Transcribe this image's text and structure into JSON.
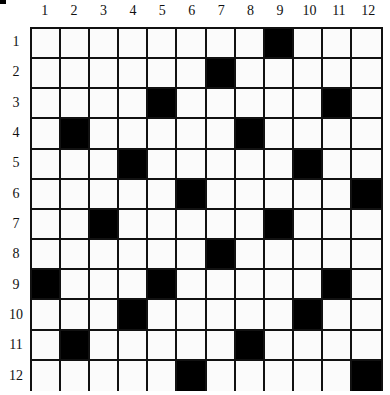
{
  "grid": {
    "rows": 12,
    "cols": 12,
    "column_labels": [
      "1",
      "2",
      "3",
      "4",
      "5",
      "6",
      "7",
      "8",
      "9",
      "10",
      "11",
      "12"
    ],
    "row_labels": [
      "1",
      "2",
      "3",
      "4",
      "5",
      "6",
      "7",
      "8",
      "9",
      "10",
      "11",
      "12"
    ],
    "black_cells": {
      "1": [
        9
      ],
      "2": [
        7
      ],
      "3": [
        5,
        11
      ],
      "4": [
        2,
        8
      ],
      "5": [
        4,
        10
      ],
      "6": [
        6,
        12
      ],
      "7": [
        3,
        9
      ],
      "8": [
        7
      ],
      "9": [
        1,
        5,
        11
      ],
      "10": [
        4,
        10
      ],
      "11": [
        2,
        8
      ],
      "12": [
        6,
        12
      ]
    },
    "colors": {
      "black_cell": "#000000",
      "white_cell": "#fbfbfb",
      "line": "#111111"
    }
  }
}
